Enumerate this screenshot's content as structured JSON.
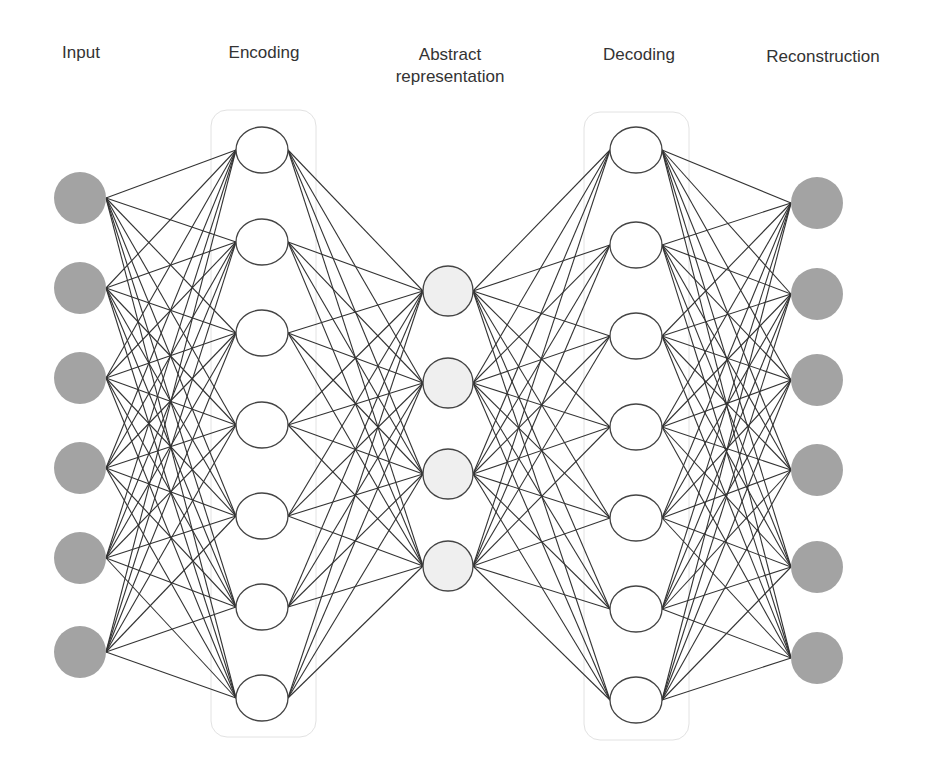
{
  "diagram": {
    "colors": {
      "background": "#ffffff",
      "edge": "#333333",
      "label_text": "#333333",
      "io_node_fill": "#a3a3a3",
      "hidden_node_fill": "#ffffff",
      "hidden_node_stroke": "#444444",
      "latent_node_fill": "#efefef",
      "group_box_stroke": "#e2e2e2"
    },
    "layers": [
      {
        "id": "input",
        "label_lines": [
          "Input"
        ],
        "label_x": 81,
        "label_y": 42,
        "node_style": "io",
        "x": 80,
        "rx": 26,
        "ry": 26,
        "nodes_y": [
          198,
          288,
          378,
          468,
          558,
          652
        ]
      },
      {
        "id": "encoding",
        "label_lines": [
          "Encoding"
        ],
        "label_x": 264,
        "label_y": 42,
        "node_style": "hidden",
        "x": 262,
        "rx": 26,
        "ry": 23,
        "nodes_y": [
          150,
          242,
          333,
          425,
          516,
          607,
          698
        ],
        "group_box": {
          "x": 211,
          "y": 110,
          "w": 105,
          "h": 627,
          "r": 16
        }
      },
      {
        "id": "abstract",
        "label_lines": [
          "Abstract",
          "representation"
        ],
        "label_x": 450,
        "label_y": 44,
        "node_style": "latent",
        "x": 448,
        "rx": 25,
        "ry": 25,
        "nodes_y": [
          291,
          383,
          474,
          566
        ]
      },
      {
        "id": "decoding",
        "label_lines": [
          "Decoding"
        ],
        "label_x": 639,
        "label_y": 44,
        "node_style": "hidden",
        "x": 636,
        "rx": 26,
        "ry": 23,
        "nodes_y": [
          150,
          245,
          336,
          427,
          518,
          609,
          700
        ],
        "group_box": {
          "x": 584,
          "y": 112,
          "w": 105,
          "h": 628,
          "r": 16
        }
      },
      {
        "id": "reconstruction",
        "label_lines": [
          "Reconstruction"
        ],
        "label_x": 823,
        "label_y": 46,
        "node_style": "io",
        "x": 817,
        "rx": 26,
        "ry": 26,
        "nodes_y": [
          203,
          294,
          380,
          470,
          567,
          658
        ]
      }
    ],
    "connections": "fully-connected between adjacent layers"
  }
}
